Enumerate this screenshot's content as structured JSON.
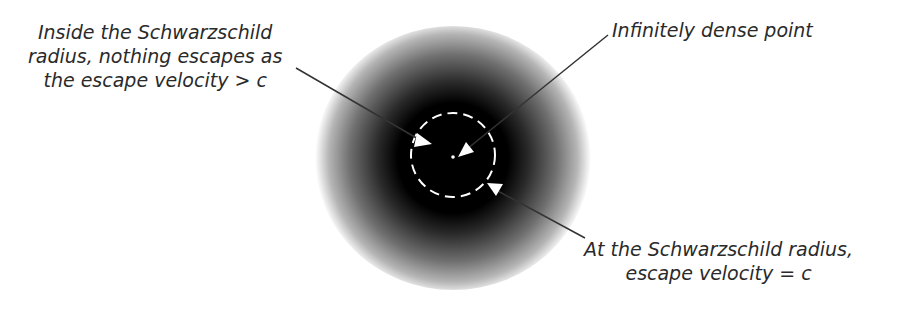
{
  "diagram": {
    "labels": {
      "inside": {
        "line1": "Inside the Schwarzschild",
        "line2": "radius, nothing escapes as",
        "line3": "the escape velocity > c"
      },
      "point": {
        "line1": "Infinitely dense point"
      },
      "radius": {
        "line1": "At the Schwarzschild radius,",
        "line2": "escape velocity = c"
      }
    },
    "colors": {
      "core": "#000000",
      "halo_edge": "#ffffff",
      "dashed_circle": "#ffffff",
      "leader_line": "#333333",
      "text": "#2a2a2a"
    }
  }
}
